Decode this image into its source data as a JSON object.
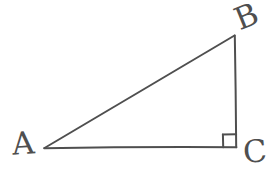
{
  "figure": {
    "kind": "geometry-diagram",
    "background_color": "#ffffff",
    "stroke_color": "#4f4f4f",
    "label_color": "#4f4f4f",
    "stroke_width": 2,
    "width": 279,
    "height": 172,
    "vertices": [
      {
        "id": "A",
        "label": "A",
        "x": 44,
        "y": 148,
        "label_x": 12,
        "label_y": 128
      },
      {
        "id": "B",
        "label": "B",
        "x": 235,
        "y": 35,
        "label_x": 235,
        "label_y": 1
      },
      {
        "id": "C",
        "label": "C",
        "x": 236,
        "y": 147,
        "label_x": 243,
        "label_y": 136
      }
    ],
    "edges": [
      {
        "id": "AB",
        "name": "hypotenuse",
        "from": "A",
        "to": "B"
      },
      {
        "id": "BC",
        "name": "vertical-leg",
        "from": "B",
        "to": "C"
      },
      {
        "id": "AC",
        "name": "horizontal-leg",
        "from": "A",
        "to": "C"
      }
    ],
    "right_angle": {
      "at": "C",
      "marker": "square",
      "size": 13,
      "x": 223,
      "y": 134
    }
  }
}
